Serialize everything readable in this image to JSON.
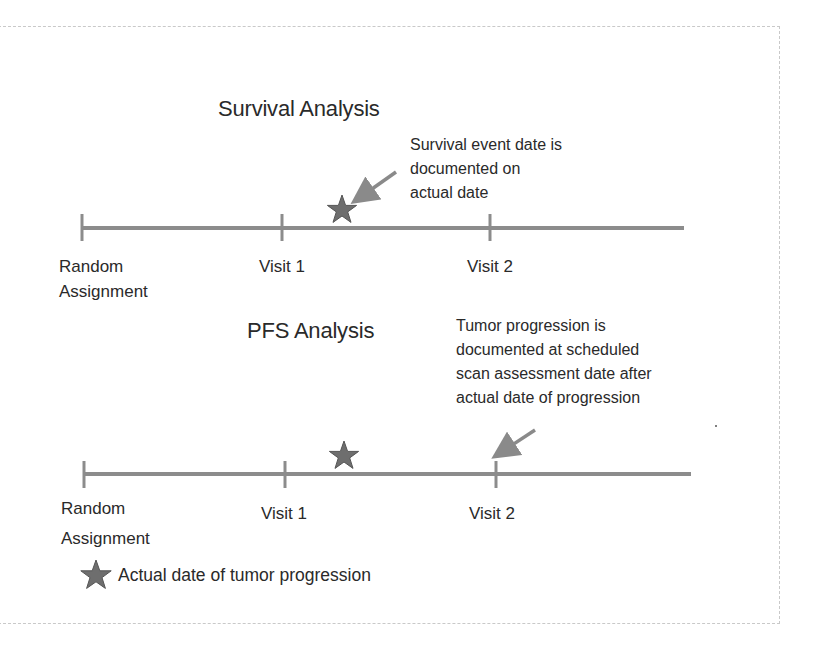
{
  "survival_section": {
    "title": "Survival Analysis",
    "annotation_lines": [
      "Survival event date is",
      "documented on",
      "actual date"
    ],
    "timeline": {
      "labels": {
        "start_line1": "Random",
        "start_line2": "Assignment",
        "visit1": "Visit 1",
        "visit2": "Visit 2"
      },
      "star_position": "on line, between Visit 1 and Visit 2"
    }
  },
  "pfs_section": {
    "title": "PFS Analysis",
    "annotation_lines": [
      "Tumor progression is",
      "documented at scheduled",
      "scan assessment date after",
      "actual date of progression"
    ],
    "timeline": {
      "labels": {
        "start_line1": "Random",
        "start_line2": "Assignment",
        "visit1": "Visit 1",
        "visit2": "Visit 2"
      },
      "star_position": "above line, between Visit 1 and Visit 2; arrow points to Visit 2"
    }
  },
  "legend": {
    "icon": "star-icon",
    "label": "Actual date of tumor progression"
  },
  "colors": {
    "timeline": "#8c8c8c",
    "star_fill": "#6e6e6e",
    "star_stroke": "#555555",
    "arrow": "#8a8a8a",
    "text": "#2a2a2a",
    "frame": "#c9c9c9"
  }
}
